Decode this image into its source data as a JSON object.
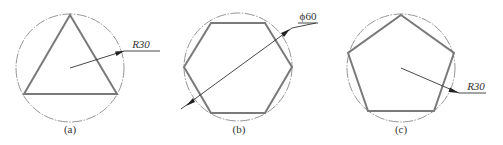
{
  "figure": {
    "panels": [
      {
        "id": "a",
        "caption": "(a)",
        "shape": "equilateral triangle",
        "sides": 3,
        "dimension": {
          "prefix": "R",
          "value": "30",
          "label": "R30",
          "type": "radius"
        }
      },
      {
        "id": "b",
        "caption": "(b)",
        "shape": "regular hexagon",
        "sides": 6,
        "dimension": {
          "prefix": "ϕ",
          "value": "60",
          "label": "ϕ60",
          "type": "diameter"
        }
      },
      {
        "id": "c",
        "caption": "(c)",
        "shape": "regular pentagon",
        "sides": 5,
        "dimension": {
          "prefix": "R",
          "value": "30",
          "label": "R30",
          "type": "radius"
        }
      }
    ]
  },
  "colors": {
    "circle": "#8a8a8a",
    "polygon": "#7a7a7a",
    "leader": "#333333",
    "text": "#333333",
    "background": "#ffffff"
  }
}
